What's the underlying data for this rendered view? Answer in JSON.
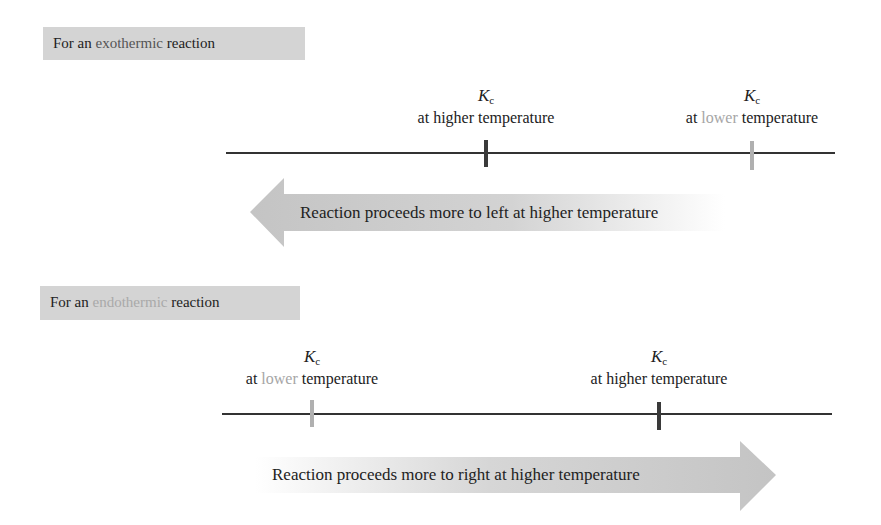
{
  "colors": {
    "label_bg": "#d4d4d4",
    "axis": "#333333",
    "tick_higher": "#3a3a3a",
    "tick_lower": "#b0b0b0",
    "arrow_fill": "#c9c9c9",
    "exothermic_word": "#555555",
    "endothermic_word": "#a9a9a9",
    "lower_word": "#a6a6a6"
  },
  "exothermic": {
    "label": {
      "prefix": "For an ",
      "keyword": "exothermic",
      "suffix": " reaction"
    },
    "kc_higher": {
      "symbol": "K",
      "subscript": "c",
      "line_prefix": "at ",
      "temp_word": "higher",
      "line_suffix": " temperature"
    },
    "kc_lower": {
      "symbol": "K",
      "subscript": "c",
      "line_prefix": "at ",
      "temp_word": "lower",
      "line_suffix": " temperature"
    },
    "arrow": {
      "direction": "left",
      "text": "Reaction proceeds more to left at higher temperature"
    }
  },
  "endothermic": {
    "label": {
      "prefix": "For an ",
      "keyword": "endothermic",
      "suffix": " reaction"
    },
    "kc_lower": {
      "symbol": "K",
      "subscript": "c",
      "line_prefix": "at ",
      "temp_word": "lower",
      "line_suffix": " temperature"
    },
    "kc_higher": {
      "symbol": "K",
      "subscript": "c",
      "line_prefix": "at ",
      "temp_word": "higher",
      "line_suffix": " temperature"
    },
    "arrow": {
      "direction": "right",
      "text": "Reaction proceeds more to right at higher temperature"
    }
  }
}
